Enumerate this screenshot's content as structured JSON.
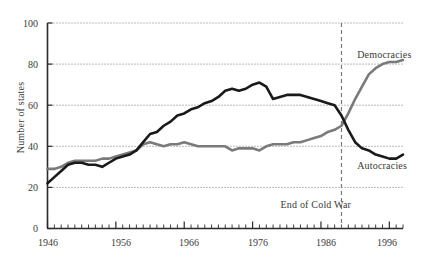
{
  "chart_data": {
    "type": "line",
    "title": "",
    "xlabel": "",
    "ylabel": "Number of states",
    "xlim": [
      1946,
      1998
    ],
    "ylim": [
      0,
      100
    ],
    "grid": true,
    "grid_axis": "y",
    "legend_position": "inline-right",
    "y_ticks": [
      0,
      20,
      40,
      60,
      80,
      100
    ],
    "x_ticks": [
      1946,
      1956,
      1966,
      1976,
      1986,
      1996
    ],
    "x_minor_tick_interval": 1,
    "annotations": [
      {
        "text": "End of Cold War",
        "type": "vertical-dashed-line",
        "x": 1989,
        "label_x": 1989,
        "label_y": 11,
        "color": "#7a7a7a"
      }
    ],
    "x": [
      1946,
      1947,
      1948,
      1949,
      1950,
      1951,
      1952,
      1953,
      1954,
      1955,
      1956,
      1957,
      1958,
      1959,
      1960,
      1961,
      1962,
      1963,
      1964,
      1965,
      1966,
      1967,
      1968,
      1969,
      1970,
      1971,
      1972,
      1973,
      1974,
      1975,
      1976,
      1977,
      1978,
      1979,
      1980,
      1981,
      1982,
      1983,
      1984,
      1985,
      1986,
      1987,
      1988,
      1989,
      1990,
      1991,
      1992,
      1993,
      1994,
      1995,
      1996,
      1997,
      1998
    ],
    "series": [
      {
        "name": "Autocracies",
        "color": "#1a1a1a",
        "label_position": {
          "x": 1991,
          "y": 30
        },
        "values": [
          22,
          25,
          28,
          31,
          32,
          32,
          31,
          31,
          30,
          32,
          34,
          35,
          36,
          38,
          42,
          46,
          47,
          50,
          52,
          55,
          56,
          58,
          59,
          61,
          62,
          64,
          67,
          68,
          67,
          68,
          70,
          71,
          69,
          63,
          64,
          65,
          65,
          65,
          64,
          63,
          62,
          61,
          60,
          55,
          48,
          42,
          39,
          38,
          36,
          35,
          34,
          34,
          36
        ]
      },
      {
        "name": "Democracies",
        "color": "#7a7a7a",
        "label_position": {
          "x": 1991,
          "y": 84
        },
        "values": [
          29,
          29,
          30,
          32,
          33,
          33,
          33,
          33,
          34,
          34,
          35,
          36,
          37,
          38,
          41,
          42,
          41,
          40,
          41,
          41,
          42,
          41,
          40,
          40,
          40,
          40,
          40,
          38,
          39,
          39,
          39,
          38,
          40,
          41,
          41,
          41,
          42,
          42,
          43,
          44,
          45,
          47,
          48,
          50,
          56,
          63,
          69,
          75,
          78,
          80,
          81,
          81,
          82
        ]
      }
    ]
  },
  "labels": {
    "y_axis_title": "Number of states",
    "series_democracies": "Democracies",
    "series_autocracies": "Autocracies",
    "cold_war_annotation": "End of Cold War",
    "y0": "0",
    "y20": "20",
    "y40": "40",
    "y60": "60",
    "y80": "80",
    "y100": "100",
    "x1946": "1946",
    "x1956": "1956",
    "x1966": "1966",
    "x1976": "1976",
    "x1986": "1986",
    "x1996": "1996"
  },
  "colors": {
    "autocracies": "#1a1a1a",
    "democracies": "#7a7a7a",
    "axis": "#2a2a2a",
    "grid": "#555555",
    "background": "#ffffff"
  }
}
